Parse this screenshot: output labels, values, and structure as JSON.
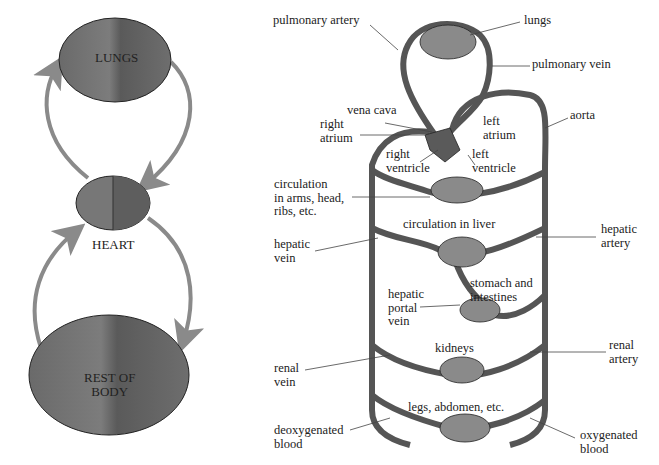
{
  "left_diagram": {
    "lungs_label": "LUNGS",
    "heart_label": "HEART",
    "body_label": "REST OF\nBODY"
  },
  "right_diagram": {
    "labels": {
      "pulmonary_artery": "pulmonary artery",
      "lungs": "lungs",
      "pulmonary_vein": "pulmonary vein",
      "vena_cava": "vena cava",
      "right_atrium": "right\natrium",
      "left_atrium": "left\natrium",
      "aorta": "aorta",
      "right_ventricle": "right\nventricle",
      "left_ventricle": "left\nventricle",
      "circulation_arms": "circulation\nin arms, head,\nribs, etc.",
      "circulation_liver": "circulation in liver",
      "hepatic_vein": "hepatic\nvein",
      "hepatic_artery": "hepatic\nartery",
      "stomach": "stomach and\nintestines",
      "hepatic_portal_vein": "hepatic\nportal\nvein",
      "kidneys": "kidneys",
      "renal_vein": "renal\nvein",
      "renal_artery": "renal\nartery",
      "legs": "legs, abdomen, etc.",
      "deoxygenated": "deoxygenated\nblood",
      "oxygenated": "oxygenated\nblood"
    }
  },
  "colors": {
    "organ_fill": "#6e6e6e",
    "arrow": "#8a8a8a",
    "vessel": "#6a6a6a"
  }
}
